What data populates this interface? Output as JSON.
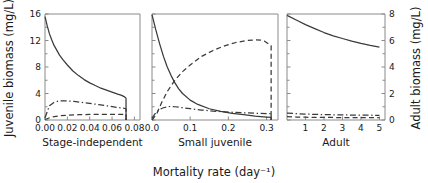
{
  "chart_data": {
    "type": "line",
    "title": "",
    "xlabel": "Mortality rate (day⁻¹)",
    "ylabel": "Juvenile biomass (mg/L)",
    "ylabel_right": "Adult biomass (mg/L)",
    "ylim": [
      0,
      16
    ],
    "yticks": [
      0,
      4,
      8,
      12,
      16
    ],
    "ylim_right": [
      0,
      8
    ],
    "yticks_right": [
      0,
      2,
      4,
      6,
      8
    ],
    "grid": false,
    "legend": "none",
    "series_styles": [
      "solid",
      "dash-dot",
      "dashed"
    ],
    "panels": [
      {
        "label": "Stage-independent",
        "xlim": [
          0,
          0.085
        ],
        "xticks": [
          0,
          0.02,
          0.04,
          0.06,
          0.08
        ],
        "xticklabels": [
          "0.00",
          "0.02",
          "0.04",
          "0.06",
          "0.08"
        ],
        "series": [
          {
            "name": "solid",
            "style": "solid",
            "x": [
              0.0,
              0.002,
              0.004,
              0.006,
              0.008,
              0.01,
              0.013,
              0.016,
              0.02,
              0.025,
              0.03,
              0.035,
              0.04,
              0.045,
              0.05,
              0.055,
              0.06,
              0.065,
              0.068,
              0.07,
              0.0715,
              0.0725,
              0.0725
            ],
            "y": [
              15.6,
              14.2,
              13.0,
              12.1,
              11.3,
              10.7,
              9.8,
              9.1,
              8.3,
              7.4,
              6.7,
              6.1,
              5.6,
              5.2,
              4.8,
              4.5,
              4.2,
              3.9,
              3.75,
              3.6,
              3.45,
              3.3,
              0.0
            ]
          },
          {
            "name": "dash-dot",
            "style": "dash-dot",
            "x": [
              0.0,
              0.004,
              0.008,
              0.012,
              0.016,
              0.02,
              0.026,
              0.032,
              0.04,
              0.048,
              0.056,
              0.064,
              0.07,
              0.0725,
              0.0725
            ],
            "y": [
              0.35,
              2.15,
              2.65,
              2.85,
              2.9,
              2.88,
              2.8,
              2.68,
              2.5,
              2.32,
              2.12,
              1.92,
              1.78,
              1.7,
              0.0
            ]
          },
          {
            "name": "dashed",
            "style": "dashed",
            "x": [
              0.0,
              0.006,
              0.012,
              0.02,
              0.03,
              0.04,
              0.05,
              0.06,
              0.068,
              0.0725,
              0.0725
            ],
            "y": [
              0.08,
              0.45,
              0.62,
              0.72,
              0.8,
              0.84,
              0.86,
              0.86,
              0.85,
              0.84,
              0.0
            ]
          }
        ]
      },
      {
        "label": "Small juvenile",
        "xlim": [
          0,
          0.33
        ],
        "xticks": [
          0,
          0.1,
          0.2,
          0.3
        ],
        "xticklabels": [
          "0.0",
          "0.1",
          "0.2",
          "0.3"
        ],
        "series": [
          {
            "name": "solid",
            "style": "solid",
            "x": [
              0.0,
              0.01,
              0.02,
              0.03,
              0.04,
              0.05,
              0.06,
              0.07,
              0.08,
              0.1,
              0.12,
              0.15,
              0.18,
              0.21,
              0.24,
              0.27,
              0.3,
              0.312,
              0.312
            ],
            "y": [
              15.9,
              13.6,
              11.5,
              9.6,
              8.0,
              6.7,
              5.6,
              4.7,
              4.0,
              3.0,
              2.35,
              1.7,
              1.3,
              1.0,
              0.8,
              0.6,
              0.45,
              0.4,
              0.0
            ]
          },
          {
            "name": "dashed",
            "style": "dashed",
            "x": [
              0.0,
              0.012,
              0.025,
              0.04,
              0.06,
              0.08,
              0.1,
              0.13,
              0.16,
              0.19,
              0.22,
              0.25,
              0.27,
              0.285,
              0.295,
              0.305,
              0.312,
              0.312
            ],
            "y": [
              0.0,
              0.9,
              2.6,
              4.3,
              6.0,
              7.3,
              8.3,
              9.6,
              10.5,
              11.2,
              11.7,
              12.0,
              12.1,
              12.05,
              11.9,
              11.5,
              11.2,
              0.0
            ]
          },
          {
            "name": "dash-dot",
            "style": "dash-dot",
            "x": [
              0.0,
              0.01,
              0.02,
              0.03,
              0.04,
              0.05,
              0.06,
              0.08,
              0.1,
              0.13,
              0.16,
              0.2,
              0.24,
              0.28,
              0.3,
              0.312,
              0.312
            ],
            "y": [
              0.3,
              1.1,
              1.6,
              1.85,
              2.0,
              2.05,
              2.0,
              1.85,
              1.7,
              1.5,
              1.35,
              1.2,
              1.08,
              1.0,
              0.98,
              0.95,
              0.0
            ]
          }
        ]
      },
      {
        "label": "Adult",
        "xlim": [
          0,
          5.3
        ],
        "xticks": [
          1,
          2,
          3,
          4,
          5
        ],
        "xticklabels": [
          "1",
          "2",
          "3",
          "4",
          "5"
        ],
        "series": [
          {
            "name": "solid",
            "style": "solid",
            "x": [
              0.0,
              0.5,
              1.0,
              1.5,
              2.0,
              2.5,
              3.0,
              3.5,
              4.0,
              4.5,
              5.0
            ],
            "y": [
              15.8,
              15.1,
              14.4,
              13.8,
              13.2,
              12.7,
              12.3,
              11.9,
              11.55,
              11.25,
              11.0
            ]
          },
          {
            "name": "dash-dot",
            "style": "dash-dot",
            "x": [
              0.0,
              0.5,
              1.0,
              1.5,
              2.0,
              2.5,
              3.0,
              3.5,
              4.0,
              4.5,
              5.0
            ],
            "y": [
              1.05,
              0.96,
              0.9,
              0.85,
              0.82,
              0.79,
              0.77,
              0.75,
              0.73,
              0.72,
              0.7
            ]
          },
          {
            "name": "dashed",
            "style": "dashed",
            "x": [
              0.0,
              0.5,
              1.0,
              1.5,
              2.0,
              2.5,
              3.0,
              3.5,
              4.0,
              4.5,
              5.0
            ],
            "y": [
              0.5,
              0.45,
              0.42,
              0.4,
              0.39,
              0.38,
              0.37,
              0.36,
              0.35,
              0.35,
              0.34
            ]
          }
        ]
      }
    ]
  }
}
